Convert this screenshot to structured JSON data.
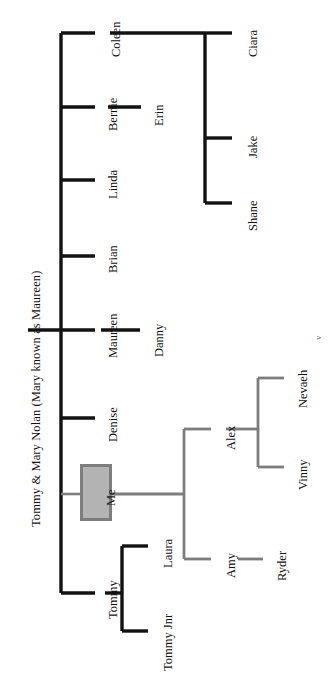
{
  "diagram": {
    "type": "family-tree",
    "orientation": "rotated-90-clockwise",
    "title": "Tommy & Mary Nolan (Mary known as Maureen)",
    "root_label": "Tommy & Mary Nolan (Mary known as Maureen)",
    "highlight_node": "Me",
    "colors": {
      "line_black": "#121212",
      "line_gray": "#7d7d7d",
      "highlight_fill": "#b3b3b3",
      "highlight_border": "#7d7d7d",
      "background": "#ffffff",
      "text": "#121212"
    },
    "generations": {
      "children_of_root": [
        "Coleen",
        "Bernie",
        "Linda",
        "Brian",
        "Maureen",
        "Denise",
        "Me",
        "Tommy"
      ],
      "grandchildren": [
        "Ciara",
        "Jake",
        "Shane",
        "Erin",
        "Danny",
        "Alex",
        "Amy",
        "Laura",
        "Tommy Jnr"
      ],
      "great_grandchildren": [
        "Nevaeh",
        "Vinny",
        "Ryder"
      ]
    },
    "nodes": [
      {
        "id": "root",
        "label": "Tommy & Mary Nolan (Mary known as Maureen)",
        "parent": null,
        "style": "plain"
      },
      {
        "id": "coleen",
        "label": "Coleen",
        "parent": "root",
        "style": "plain"
      },
      {
        "id": "bernie",
        "label": "Bernie",
        "parent": "root",
        "style": "plain"
      },
      {
        "id": "linda",
        "label": "Linda",
        "parent": "root",
        "style": "plain"
      },
      {
        "id": "brian",
        "label": "Brian",
        "parent": "root",
        "style": "plain"
      },
      {
        "id": "maureen",
        "label": "Maureen",
        "parent": "root",
        "style": "plain"
      },
      {
        "id": "denise",
        "label": "Denise",
        "parent": "root",
        "style": "plain"
      },
      {
        "id": "me",
        "label": "Me",
        "parent": "root",
        "style": "highlight-box"
      },
      {
        "id": "tommy",
        "label": "Tommy",
        "parent": "root",
        "style": "plain"
      },
      {
        "id": "ciara",
        "label": "Ciara",
        "parent": "coleen",
        "style": "plain"
      },
      {
        "id": "jake",
        "label": "Jake",
        "parent": "coleen",
        "style": "plain"
      },
      {
        "id": "shane",
        "label": "Shane",
        "parent": "coleen",
        "style": "plain"
      },
      {
        "id": "erin",
        "label": "Erin",
        "parent": "bernie",
        "style": "plain"
      },
      {
        "id": "danny",
        "label": "Danny",
        "parent": "maureen",
        "style": "plain"
      },
      {
        "id": "alex",
        "label": "Alex",
        "parent": "me",
        "style": "plain"
      },
      {
        "id": "amy",
        "label": "Amy",
        "parent": "me",
        "style": "plain"
      },
      {
        "id": "nevaeh",
        "label": "Nevaeh",
        "parent": "alex",
        "style": "plain"
      },
      {
        "id": "vinny",
        "label": "Vinny",
        "parent": "alex",
        "style": "plain"
      },
      {
        "id": "ryder",
        "label": "Ryder",
        "parent": "amy",
        "style": "plain"
      },
      {
        "id": "laura",
        "label": "Laura",
        "parent": "tommy",
        "style": "plain"
      },
      {
        "id": "tommyjnr",
        "label": "Tommy Jnr",
        "parent": "tommy",
        "style": "plain"
      }
    ],
    "stray_marker": "v"
  }
}
